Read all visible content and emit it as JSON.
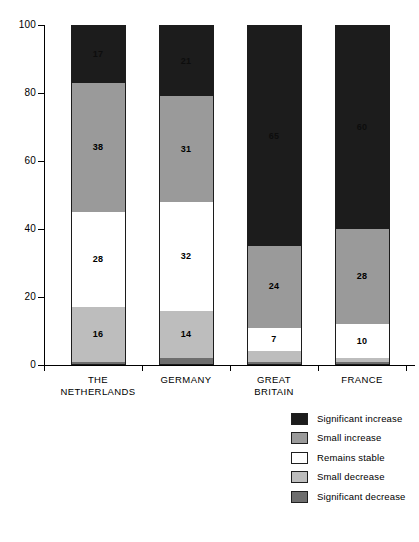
{
  "chart_data": {
    "type": "bar",
    "subtype": "stacked-bar-100",
    "title": "",
    "xlabel": "",
    "ylabel": "",
    "ylim": [
      0,
      100
    ],
    "yticks": [
      0,
      20,
      40,
      60,
      80,
      100
    ],
    "grid": false,
    "legend_position": "right-bottom",
    "categories": [
      "THE NETHERLANDS",
      "GERMANY",
      "GREAT BRITAIN",
      "FRANCE"
    ],
    "category_lines": [
      [
        "THE",
        "NETHERLANDS"
      ],
      [
        "GERMANY",
        ""
      ],
      [
        "GREAT",
        "BRITAIN"
      ],
      [
        "FRANCE",
        ""
      ]
    ],
    "series": [
      {
        "name": "Significant increase",
        "color": "#1c1c1c",
        "values": [
          17,
          21,
          65,
          60
        ],
        "labels": [
          "17",
          "21",
          "65",
          "60"
        ],
        "label_on_dark": true
      },
      {
        "name": "Small increase",
        "color": "#9a9a9a",
        "values": [
          38,
          31,
          24,
          28
        ],
        "labels": [
          "38",
          "31",
          "24",
          "28"
        ],
        "label_on_dark": false
      },
      {
        "name": "Remains stable",
        "color": "#ffffff",
        "values": [
          28,
          32,
          7,
          10
        ],
        "labels": [
          "28",
          "32",
          "7",
          "10"
        ],
        "label_on_dark": false
      },
      {
        "name": "Small decrease",
        "color": "#bdbdbd",
        "values": [
          16,
          14,
          3,
          1
        ],
        "labels": [
          "16",
          "14",
          "",
          ""
        ],
        "label_on_dark": false
      },
      {
        "name": "Significant decrease",
        "color": "#6e6e6e",
        "values": [
          1,
          2,
          1,
          1
        ],
        "labels": [
          "",
          "",
          "",
          ""
        ],
        "label_on_dark": false
      }
    ]
  },
  "axis": {
    "y_tick_labels": [
      "100",
      "80",
      "60",
      "40",
      "20",
      "0"
    ]
  },
  "legend": {
    "items": [
      {
        "label": "Significant increase",
        "color": "#1c1c1c"
      },
      {
        "label": "Small increase",
        "color": "#9a9a9a"
      },
      {
        "label": "Remains stable",
        "color": "#ffffff"
      },
      {
        "label": "Small decrease",
        "color": "#bdbdbd"
      },
      {
        "label": "Significant decrease",
        "color": "#6e6e6e"
      }
    ]
  }
}
